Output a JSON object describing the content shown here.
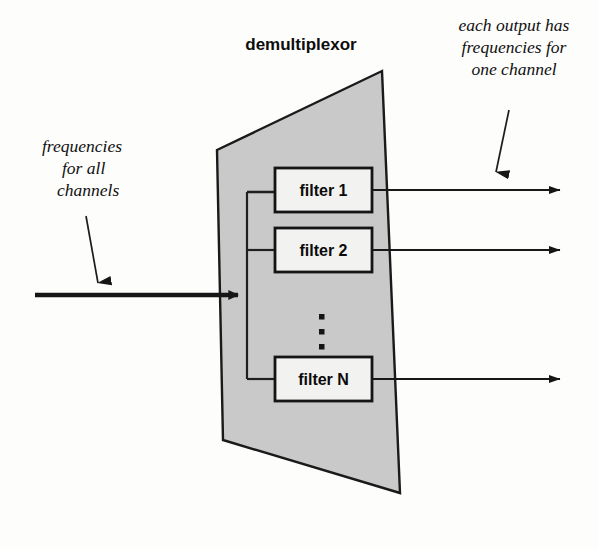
{
  "figure": {
    "title": "demultiplexor",
    "background_color": "#fdfdfc",
    "ink_color": "#1a1a1a",
    "body_fill": "#c9c9c9"
  },
  "annotations": {
    "input": {
      "name": "input-annotation",
      "lines": [
        "frequencies",
        "for all",
        "channels"
      ]
    },
    "output": {
      "name": "output-annotation",
      "lines": [
        "each output has",
        "frequencies for",
        "one channel"
      ]
    }
  },
  "filters": [
    {
      "label": "filter 1",
      "output_index": 1
    },
    {
      "label": "filter 2",
      "output_index": 2
    },
    {
      "label": "filter N",
      "output_index": 3
    }
  ],
  "ellipsis": {
    "name": "vertical-ellipsis",
    "dot_count": 3
  },
  "flows": {
    "input_arrow_label": "frequencies for all channels input",
    "output_arrow_labels": [
      "output channel 1",
      "output channel 2",
      "output channel N"
    ]
  }
}
